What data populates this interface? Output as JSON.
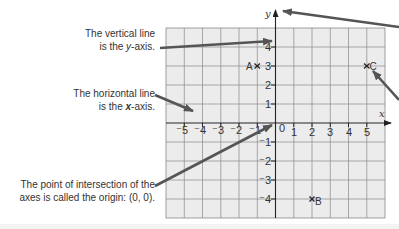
{
  "callouts": {
    "y_axis": {
      "line1": "The vertical line",
      "line2_pre": "is the ",
      "line2_var": "y",
      "line2_post": "-axis."
    },
    "x_axis": {
      "line1": "The horizontal line",
      "line2_pre": "is the ",
      "line2_var": "x",
      "line2_post": "-axis."
    },
    "origin": {
      "line1": "The point of intersection of the",
      "line2": "axes is called the origin: (0, 0)."
    }
  },
  "axes": {
    "x_label": "x",
    "y_label": "y",
    "origin_label": "0",
    "x_ticks": [
      "⁻5",
      "⁻4",
      "⁻3",
      "⁻2",
      "⁻1",
      "1",
      "2",
      "3",
      "4",
      "5"
    ],
    "y_ticks": [
      "4",
      "3",
      "2",
      "1",
      "⁻1",
      "⁻2",
      "⁻3",
      "⁻4"
    ],
    "x_range": [
      -6,
      6
    ],
    "y_range": [
      -5,
      5
    ]
  },
  "points": [
    {
      "label": "A",
      "x": -1,
      "y": 3
    },
    {
      "label": "B",
      "x": 2,
      "y": -4
    },
    {
      "label": "C",
      "x": 5,
      "y": 3
    }
  ],
  "colors": {
    "grid_bg": "#ececec",
    "grid_line": "#8a8a8a",
    "axis": "#222222",
    "callout_arrow": "#555555",
    "text": "#333333"
  }
}
